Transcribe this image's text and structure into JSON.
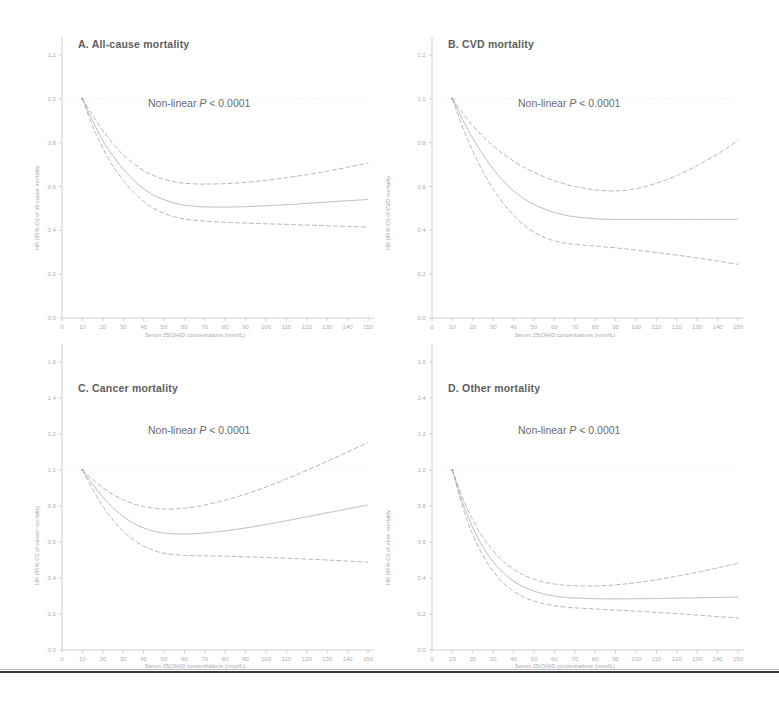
{
  "figure": {
    "background_color": "#ffffff",
    "ink_color": "#8d8d8d",
    "bottom_rule_color": "#3a3a3a"
  },
  "shared": {
    "xlabel": "Serum 25(OH)D concentrations (nmol/L)",
    "xticks": [
      "0",
      "10",
      "20",
      "30",
      "40",
      "50",
      "60",
      "70",
      "80",
      "90",
      "100",
      "110",
      "120",
      "130",
      "140",
      "150"
    ],
    "pvalue_prefix": "Non-linear ",
    "pvalue_italic": "P",
    "pvalue_suffix": " < 0.0001"
  },
  "chart_data": [
    {
      "type": "line",
      "panel": "A",
      "title": "A. All-cause mortality",
      "annotation": "Non-linear P < 0.0001",
      "xlabel": "Serum 25(OH)D concentrations (nmol/L)",
      "ylabel": "HR (95% CI) of all-cause mortality",
      "xlim": [
        0,
        150
      ],
      "ylim": [
        0.0,
        1.2
      ],
      "xticks": [
        0,
        10,
        20,
        30,
        40,
        50,
        60,
        70,
        80,
        90,
        100,
        110,
        120,
        130,
        140,
        150
      ],
      "yticks": [
        0.0,
        0.2,
        0.4,
        0.6,
        0.8,
        1.0,
        1.2
      ],
      "ytick_labels": [
        "0.0",
        "0.2",
        "0.4",
        "0.6",
        "0.8",
        "1.0",
        "1.2"
      ],
      "grid": false,
      "legend": "none",
      "reference_point": {
        "x": 10,
        "y": 1.0
      },
      "x": [
        10,
        15,
        20,
        25,
        30,
        35,
        40,
        45,
        50,
        55,
        60,
        65,
        70,
        80,
        90,
        100,
        110,
        120,
        130,
        140,
        150
      ],
      "series": [
        {
          "name": "Hazard ratio (point estimate)",
          "style": "solid",
          "values": [
            1.0,
            0.9,
            0.81,
            0.74,
            0.68,
            0.63,
            0.59,
            0.56,
            0.54,
            0.525,
            0.515,
            0.51,
            0.507,
            0.506,
            0.508,
            0.512,
            0.517,
            0.523,
            0.529,
            0.535,
            0.541
          ]
        },
        {
          "name": "Upper 95% CI",
          "style": "dashed",
          "values": [
            1.0,
            0.925,
            0.855,
            0.795,
            0.745,
            0.705,
            0.673,
            0.65,
            0.633,
            0.622,
            0.615,
            0.612,
            0.611,
            0.613,
            0.619,
            0.628,
            0.64,
            0.654,
            0.67,
            0.688,
            0.708
          ]
        },
        {
          "name": "Lower 95% CI",
          "style": "dashed",
          "values": [
            1.0,
            0.876,
            0.775,
            0.693,
            0.628,
            0.575,
            0.532,
            0.5,
            0.478,
            0.462,
            0.452,
            0.446,
            0.442,
            0.437,
            0.433,
            0.43,
            0.427,
            0.424,
            0.421,
            0.418,
            0.415
          ]
        }
      ]
    },
    {
      "type": "line",
      "panel": "B",
      "title": "B. CVD mortality",
      "annotation": "Non-linear P < 0.0001",
      "xlabel": "Serum 25(OH)D concentrations (nmol/L)",
      "ylabel": "HR (95% CI) of CVD mortality",
      "xlim": [
        0,
        150
      ],
      "ylim": [
        0.0,
        1.2
      ],
      "xticks": [
        0,
        10,
        20,
        30,
        40,
        50,
        60,
        70,
        80,
        90,
        100,
        110,
        120,
        130,
        140,
        150
      ],
      "yticks": [
        0.0,
        0.2,
        0.4,
        0.6,
        0.8,
        1.0,
        1.2
      ],
      "ytick_labels": [
        "0.0",
        "0.2",
        "0.4",
        "0.6",
        "0.8",
        "1.0",
        "1.2"
      ],
      "grid": false,
      "legend": "none",
      "reference_point": {
        "x": 10,
        "y": 1.0
      },
      "x": [
        10,
        15,
        20,
        25,
        30,
        35,
        40,
        45,
        50,
        55,
        60,
        65,
        70,
        80,
        90,
        100,
        110,
        120,
        130,
        140,
        150
      ],
      "series": [
        {
          "name": "Hazard ratio (point estimate)",
          "style": "solid",
          "values": [
            1.0,
            0.905,
            0.82,
            0.745,
            0.68,
            0.625,
            0.58,
            0.545,
            0.518,
            0.498,
            0.482,
            0.47,
            0.462,
            0.453,
            0.45,
            0.45,
            0.45,
            0.45,
            0.45,
            0.45,
            0.45
          ]
        },
        {
          "name": "Upper 95% CI",
          "style": "dashed",
          "values": [
            1.0,
            0.935,
            0.878,
            0.828,
            0.785,
            0.748,
            0.716,
            0.688,
            0.664,
            0.644,
            0.626,
            0.612,
            0.6,
            0.585,
            0.58,
            0.59,
            0.615,
            0.65,
            0.695,
            0.748,
            0.81
          ]
        },
        {
          "name": "Lower 95% CI",
          "style": "dashed",
          "values": [
            1.0,
            0.872,
            0.762,
            0.668,
            0.588,
            0.522,
            0.468,
            0.425,
            0.392,
            0.368,
            0.352,
            0.342,
            0.336,
            0.328,
            0.32,
            0.31,
            0.299,
            0.287,
            0.274,
            0.26,
            0.245
          ]
        }
      ]
    },
    {
      "type": "line",
      "panel": "C",
      "title": "C. Cancer mortality",
      "annotation": "Non-linear P < 0.0001",
      "xlabel": "Serum 25(OH)D concentrations (nmol/L)",
      "ylabel": "HR (95% CI) of cancer mortality",
      "xlim": [
        0,
        150
      ],
      "ylim": [
        0.0,
        1.6
      ],
      "xticks": [
        0,
        10,
        20,
        30,
        40,
        50,
        60,
        70,
        80,
        90,
        100,
        110,
        120,
        130,
        140,
        150
      ],
      "yticks": [
        0.0,
        0.2,
        0.4,
        0.6,
        0.8,
        1.0,
        1.2,
        1.4,
        1.6
      ],
      "ytick_labels": [
        "0.0",
        "0.2",
        "0.4",
        "0.6",
        "0.8",
        "1.0",
        "1.2",
        "1.4",
        "1.6"
      ],
      "grid": false,
      "legend": "none",
      "reference_point": {
        "x": 10,
        "y": 1.0
      },
      "x": [
        10,
        15,
        20,
        25,
        30,
        35,
        40,
        45,
        50,
        55,
        60,
        65,
        70,
        80,
        90,
        100,
        110,
        120,
        130,
        140,
        150
      ],
      "series": [
        {
          "name": "Hazard ratio (point estimate)",
          "style": "solid",
          "values": [
            1.0,
            0.92,
            0.85,
            0.79,
            0.742,
            0.705,
            0.678,
            0.66,
            0.65,
            0.645,
            0.644,
            0.646,
            0.65,
            0.662,
            0.678,
            0.697,
            0.718,
            0.74,
            0.762,
            0.784,
            0.806
          ]
        },
        {
          "name": "Upper 95% CI",
          "style": "dashed",
          "values": [
            1.0,
            0.948,
            0.902,
            0.864,
            0.834,
            0.812,
            0.797,
            0.788,
            0.784,
            0.784,
            0.788,
            0.795,
            0.805,
            0.832,
            0.866,
            0.906,
            0.95,
            0.998,
            1.048,
            1.1,
            1.152
          ]
        },
        {
          "name": "Lower 95% CI",
          "style": "dashed",
          "values": [
            1.0,
            0.893,
            0.8,
            0.722,
            0.66,
            0.612,
            0.577,
            0.552,
            0.538,
            0.53,
            0.526,
            0.524,
            0.523,
            0.521,
            0.518,
            0.514,
            0.51,
            0.505,
            0.5,
            0.494,
            0.488
          ]
        }
      ]
    },
    {
      "type": "line",
      "panel": "D",
      "title": "D. Other mortality",
      "annotation": "Non-linear P < 0.0001",
      "xlabel": "Serum 25(OH)D concentrations (nmol/L)",
      "ylabel": "HR (95% CI) of other mortality",
      "xlim": [
        0,
        150
      ],
      "ylim": [
        0.0,
        1.6
      ],
      "xticks": [
        0,
        10,
        20,
        30,
        40,
        50,
        60,
        70,
        80,
        90,
        100,
        110,
        120,
        130,
        140,
        150
      ],
      "yticks": [
        0.0,
        0.2,
        0.4,
        0.6,
        0.8,
        1.0,
        1.2,
        1.4,
        1.6
      ],
      "ytick_labels": [
        "0.0",
        "0.2",
        "0.4",
        "0.6",
        "0.8",
        "1.0",
        "1.2",
        "1.4",
        "1.6"
      ],
      "grid": false,
      "legend": "none",
      "reference_point": {
        "x": 10,
        "y": 1.0
      },
      "x": [
        10,
        15,
        20,
        25,
        30,
        35,
        40,
        45,
        50,
        55,
        60,
        65,
        70,
        80,
        90,
        100,
        110,
        120,
        130,
        140,
        150
      ],
      "series": [
        {
          "name": "Hazard ratio (point estimate)",
          "style": "solid",
          "values": [
            1.0,
            0.82,
            0.68,
            0.572,
            0.49,
            0.428,
            0.382,
            0.35,
            0.327,
            0.311,
            0.3,
            0.293,
            0.289,
            0.285,
            0.284,
            0.285,
            0.286,
            0.288,
            0.29,
            0.292,
            0.294
          ]
        },
        {
          "name": "Upper 95% CI",
          "style": "dashed",
          "values": [
            1.0,
            0.846,
            0.722,
            0.625,
            0.55,
            0.492,
            0.448,
            0.416,
            0.393,
            0.377,
            0.367,
            0.36,
            0.357,
            0.356,
            0.362,
            0.374,
            0.39,
            0.41,
            0.432,
            0.456,
            0.482
          ]
        },
        {
          "name": "Lower 95% CI",
          "style": "dashed",
          "values": [
            1.0,
            0.795,
            0.64,
            0.524,
            0.437,
            0.372,
            0.326,
            0.294,
            0.272,
            0.257,
            0.246,
            0.239,
            0.234,
            0.228,
            0.222,
            0.216,
            0.209,
            0.202,
            0.194,
            0.186,
            0.178
          ]
        }
      ]
    }
  ]
}
